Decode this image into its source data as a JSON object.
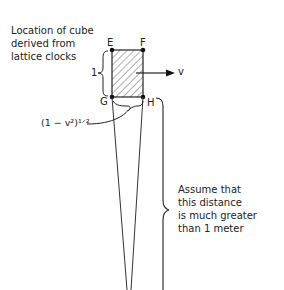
{
  "caption": {
    "line1": "Location of cube",
    "line2": "derived from",
    "line3": "lattice clocks"
  },
  "points": {
    "E": "E",
    "F": "F",
    "G": "G",
    "H": "H"
  },
  "side_length_label": "1",
  "velocity_label": "v",
  "contracted_label": "(1 − v²)¹ᐟ²",
  "distance_note": {
    "line1": "Assume that",
    "line2": "this distance",
    "line3": "is much greater",
    "line4": "than 1 meter"
  },
  "colors": {
    "ink": "#222222",
    "background": "#ffffff"
  }
}
